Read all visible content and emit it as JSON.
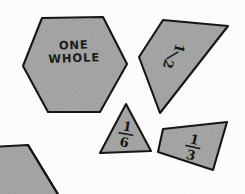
{
  "figure": {
    "background_color": "#fdfdfd",
    "shape_fill_color": "#a9a9a9",
    "outline_color": "#161616",
    "width": 245,
    "height": 194
  },
  "shapes": [
    {
      "id": "hexagon",
      "name": "hexagon",
      "label": "ONE WHOLE",
      "label_line_1": "ONE",
      "label_line_2": "WHOLE",
      "fraction_value": "1",
      "rotation_degrees": -2
    },
    {
      "id": "trapezoid-half",
      "name": "trapezoid",
      "label": "1/2",
      "numerator": "1",
      "denominator": "2",
      "fraction_value": "1/2",
      "rotation_degrees": 104
    },
    {
      "id": "triangle-sixth",
      "name": "triangle",
      "label": "1/6",
      "numerator": "1",
      "denominator": "6",
      "fraction_value": "1/6",
      "rotation_degrees": 8
    },
    {
      "id": "rhombus-third",
      "name": "rhombus",
      "label": "1/3",
      "numerator": "1",
      "denominator": "3",
      "fraction_value": "1/3",
      "rotation_degrees": 14
    },
    {
      "id": "trapezoid-partial",
      "name": "partial-trapezoid-with-triangle",
      "label": "",
      "fraction_value": "",
      "rotation_degrees": 0
    }
  ]
}
